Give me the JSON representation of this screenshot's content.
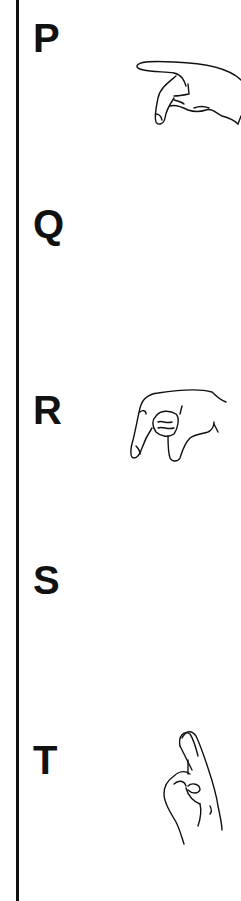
{
  "entries": [
    {
      "letter": "P",
      "icon": "hand-sign-p-icon"
    },
    {
      "letter": "Q",
      "icon": "hand-sign-q-icon"
    },
    {
      "letter": "R",
      "icon": "hand-sign-r-icon"
    },
    {
      "letter": "S",
      "icon": "hand-sign-s-icon"
    },
    {
      "letter": "T",
      "icon": "hand-sign-t-icon"
    }
  ],
  "colors": {
    "ink": "#111111",
    "background": "#ffffff"
  }
}
